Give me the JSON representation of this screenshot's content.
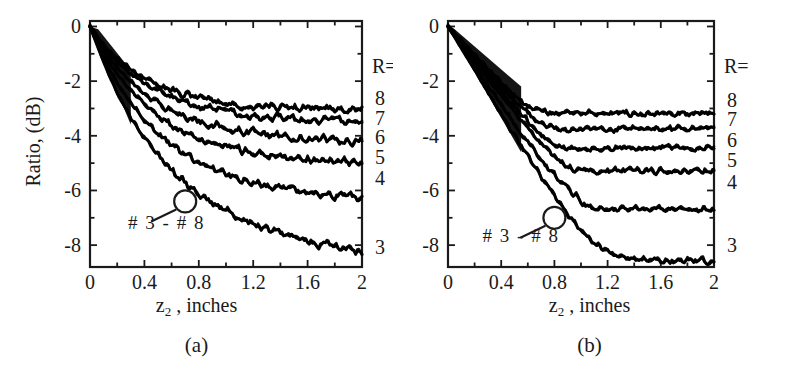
{
  "figure": {
    "ylabel": "Ratio, (dB)",
    "xlabel_main": "z",
    "xlabel_sub": "2",
    "xlabel_rest": " , inches",
    "series_annotation": "# 3 - # 8",
    "r_header": "R="
  },
  "panels": [
    {
      "id": "a",
      "caption": "(a)",
      "xlabel_main": "z",
      "xlabel_sub": "2",
      "xlabel_rest": " , inches",
      "annotation": "# 3 - # 8",
      "r_header": "R=",
      "r_labels": [
        "8",
        "7",
        "6",
        "5",
        "4",
        "3"
      ],
      "xticklabels": [
        "0",
        "0.4",
        "0.8",
        "1.2",
        "1.6",
        "2"
      ],
      "yticklabels": [
        "0",
        "-2",
        "-4",
        "-6",
        "-8"
      ]
    },
    {
      "id": "b",
      "caption": "(b)",
      "xlabel_main": "z",
      "xlabel_sub": "2",
      "xlabel_rest": " , inches",
      "annotation": "# 3 - # 8",
      "r_header": "R=",
      "r_labels": [
        "8",
        "7",
        "6",
        "5",
        "4",
        "3"
      ],
      "xticklabels": [
        "0",
        "0.4",
        "0.8",
        "1.2",
        "1.6",
        "2"
      ],
      "yticklabels": [
        "0",
        "-2",
        "-4",
        "-6",
        "-8"
      ]
    }
  ],
  "chart_data": [
    {
      "type": "line",
      "panel": "a",
      "title": "(a)",
      "xlabel": "z2 , inches",
      "ylabel": "Ratio, (dB)",
      "xlim": [
        0,
        2
      ],
      "ylim": [
        -8.8,
        0.2
      ],
      "xticks": [
        0,
        0.4,
        0.8,
        1.2,
        1.6,
        2
      ],
      "yticks": [
        0,
        -2,
        -4,
        -6,
        -8
      ],
      "grid": false,
      "legend_position": "right-outside",
      "legend_title": "R=",
      "noise_amplitude": 0.09,
      "linewidth": 3.0,
      "color": "#000000",
      "annotations": [
        {
          "text": "# 3 - # 8",
          "x": 0.28,
          "y": -7.4,
          "leader_to_x": 0.7,
          "leader_to_y": -6.4,
          "marker": "circle"
        }
      ],
      "series": [
        {
          "name": "8",
          "label": "8",
          "asymptote": -3.05,
          "x": [
            0,
            0.05,
            0.1,
            0.15,
            0.2,
            0.3,
            0.4,
            0.5,
            0.6,
            0.7,
            0.8,
            0.9,
            1.0,
            1.2,
            1.4,
            1.6,
            1.8,
            2.0
          ],
          "values": [
            0,
            -0.35,
            -0.68,
            -0.95,
            -1.18,
            -1.58,
            -1.9,
            -2.14,
            -2.34,
            -2.5,
            -2.62,
            -2.72,
            -2.8,
            -2.9,
            -2.97,
            -3.0,
            -3.03,
            -3.05
          ]
        },
        {
          "name": "7",
          "label": "7",
          "asymptote": -3.45,
          "x": [
            0,
            0.05,
            0.1,
            0.15,
            0.2,
            0.3,
            0.4,
            0.5,
            0.6,
            0.7,
            0.8,
            0.9,
            1.0,
            1.2,
            1.4,
            1.6,
            1.8,
            2.0
          ],
          "values": [
            0,
            -0.38,
            -0.74,
            -1.05,
            -1.3,
            -1.74,
            -2.1,
            -2.38,
            -2.6,
            -2.78,
            -2.93,
            -3.04,
            -3.13,
            -3.26,
            -3.35,
            -3.4,
            -3.43,
            -3.45
          ]
        },
        {
          "name": "6",
          "label": "6",
          "asymptote": -4.2,
          "x": [
            0,
            0.05,
            0.1,
            0.15,
            0.2,
            0.3,
            0.4,
            0.5,
            0.6,
            0.7,
            0.8,
            0.9,
            1.0,
            1.2,
            1.4,
            1.6,
            1.8,
            2.0
          ],
          "values": [
            0,
            -0.44,
            -0.86,
            -1.22,
            -1.52,
            -2.04,
            -2.46,
            -2.8,
            -3.08,
            -3.3,
            -3.48,
            -3.62,
            -3.73,
            -3.9,
            -4.02,
            -4.1,
            -4.16,
            -4.2
          ]
        },
        {
          "name": "5",
          "label": "5",
          "asymptote": -5.0,
          "x": [
            0,
            0.05,
            0.1,
            0.15,
            0.2,
            0.3,
            0.4,
            0.5,
            0.6,
            0.7,
            0.8,
            0.9,
            1.0,
            1.2,
            1.4,
            1.6,
            1.8,
            2.0
          ],
          "values": [
            0,
            -0.5,
            -0.98,
            -1.4,
            -1.76,
            -2.36,
            -2.86,
            -3.27,
            -3.6,
            -3.88,
            -4.1,
            -4.28,
            -4.42,
            -4.63,
            -4.78,
            -4.88,
            -4.95,
            -5.0
          ]
        },
        {
          "name": "4",
          "label": "4",
          "asymptote": -6.3,
          "x": [
            0,
            0.05,
            0.1,
            0.15,
            0.2,
            0.3,
            0.4,
            0.5,
            0.6,
            0.7,
            0.8,
            0.9,
            1.0,
            1.2,
            1.4,
            1.6,
            1.8,
            2.0
          ],
          "values": [
            0,
            -0.58,
            -1.14,
            -1.64,
            -2.08,
            -2.82,
            -3.42,
            -3.92,
            -4.33,
            -4.67,
            -4.96,
            -5.2,
            -5.4,
            -5.7,
            -5.92,
            -6.08,
            -6.2,
            -6.3
          ]
        },
        {
          "name": "3",
          "label": "3",
          "asymptote": -8.3,
          "x": [
            0,
            0.05,
            0.1,
            0.15,
            0.2,
            0.3,
            0.4,
            0.5,
            0.6,
            0.7,
            0.8,
            0.9,
            1.0,
            1.2,
            1.4,
            1.6,
            1.8,
            2.0
          ],
          "values": [
            0,
            -0.66,
            -1.3,
            -1.9,
            -2.44,
            -3.36,
            -4.12,
            -4.76,
            -5.3,
            -5.76,
            -6.15,
            -6.48,
            -6.77,
            -7.23,
            -7.58,
            -7.86,
            -8.1,
            -8.3
          ]
        }
      ]
    },
    {
      "type": "line",
      "panel": "b",
      "title": "(b)",
      "xlabel": "z2 , inches",
      "ylabel": "Ratio, (dB)",
      "xlim": [
        0,
        2
      ],
      "ylim": [
        -8.8,
        0.2
      ],
      "xticks": [
        0,
        0.4,
        0.8,
        1.2,
        1.6,
        2
      ],
      "yticks": [
        0,
        -2,
        -4,
        -6,
        -8
      ],
      "grid": false,
      "legend_position": "right-outside",
      "legend_title": "R=",
      "noise_amplitude": 0.06,
      "linewidth": 3.0,
      "color": "#000000",
      "annotations": [
        {
          "text": "# 3 - # 8",
          "x": 0.26,
          "y": -7.9,
          "leader_to_x": 0.8,
          "leader_to_y": -7.0,
          "marker": "circle"
        }
      ],
      "series": [
        {
          "name": "8",
          "label": "8",
          "knee_x": 0.62,
          "asymptote": -3.2,
          "x": [
            0,
            0.1,
            0.2,
            0.3,
            0.4,
            0.5,
            0.6,
            0.65,
            0.7,
            0.8,
            0.9,
            1.0,
            1.2,
            1.4,
            1.6,
            1.8,
            2.0
          ],
          "values": [
            0,
            -0.52,
            -1.04,
            -1.56,
            -2.08,
            -2.55,
            -2.92,
            -3.02,
            -3.1,
            -3.17,
            -3.19,
            -3.2,
            -3.2,
            -3.2,
            -3.2,
            -3.2,
            -3.2
          ]
        },
        {
          "name": "7",
          "label": "7",
          "knee_x": 0.66,
          "asymptote": -3.75,
          "x": [
            0,
            0.1,
            0.2,
            0.3,
            0.4,
            0.5,
            0.6,
            0.7,
            0.75,
            0.8,
            0.9,
            1.0,
            1.2,
            1.4,
            1.6,
            1.8,
            2.0
          ],
          "values": [
            0,
            -0.55,
            -1.1,
            -1.65,
            -2.2,
            -2.72,
            -3.2,
            -3.55,
            -3.66,
            -3.72,
            -3.75,
            -3.75,
            -3.75,
            -3.75,
            -3.75,
            -3.75,
            -3.75
          ]
        },
        {
          "name": "6",
          "label": "6",
          "knee_x": 0.72,
          "asymptote": -4.45,
          "x": [
            0,
            0.1,
            0.2,
            0.3,
            0.4,
            0.5,
            0.6,
            0.7,
            0.8,
            0.85,
            0.9,
            1.0,
            1.2,
            1.4,
            1.6,
            1.8,
            2.0
          ],
          "values": [
            0,
            -0.6,
            -1.2,
            -1.8,
            -2.4,
            -2.96,
            -3.5,
            -3.95,
            -4.3,
            -4.4,
            -4.44,
            -4.45,
            -4.45,
            -4.45,
            -4.45,
            -4.45,
            -4.45
          ]
        },
        {
          "name": "5",
          "label": "5",
          "knee_x": 0.8,
          "asymptote": -5.3,
          "x": [
            0,
            0.1,
            0.2,
            0.3,
            0.4,
            0.5,
            0.6,
            0.7,
            0.8,
            0.9,
            0.95,
            1.0,
            1.2,
            1.4,
            1.6,
            1.8,
            2.0
          ],
          "values": [
            0,
            -0.64,
            -1.28,
            -1.92,
            -2.56,
            -3.18,
            -3.76,
            -4.3,
            -4.76,
            -5.14,
            -5.25,
            -5.3,
            -5.3,
            -5.3,
            -5.3,
            -5.3,
            -5.3
          ]
        },
        {
          "name": "4",
          "label": "4",
          "knee_x": 0.88,
          "asymptote": -6.7,
          "x": [
            0,
            0.1,
            0.2,
            0.3,
            0.4,
            0.5,
            0.6,
            0.7,
            0.8,
            0.9,
            1.0,
            1.05,
            1.1,
            1.2,
            1.4,
            1.6,
            1.8,
            2.0
          ],
          "values": [
            0,
            -0.72,
            -1.44,
            -2.16,
            -2.88,
            -3.58,
            -4.25,
            -4.88,
            -5.45,
            -5.95,
            -6.4,
            -6.55,
            -6.63,
            -6.69,
            -6.7,
            -6.7,
            -6.7,
            -6.7
          ]
        },
        {
          "name": "3",
          "label": "3",
          "knee_x": 1.0,
          "asymptote": -8.6,
          "x": [
            0,
            0.1,
            0.2,
            0.3,
            0.4,
            0.5,
            0.6,
            0.7,
            0.8,
            0.9,
            1.0,
            1.1,
            1.2,
            1.3,
            1.4,
            1.6,
            1.8,
            2.0
          ],
          "values": [
            0,
            -0.8,
            -1.6,
            -2.4,
            -3.2,
            -4.0,
            -4.78,
            -5.52,
            -6.2,
            -6.85,
            -7.45,
            -7.95,
            -8.26,
            -8.44,
            -8.53,
            -8.59,
            -8.6,
            -8.6
          ]
        }
      ]
    }
  ]
}
